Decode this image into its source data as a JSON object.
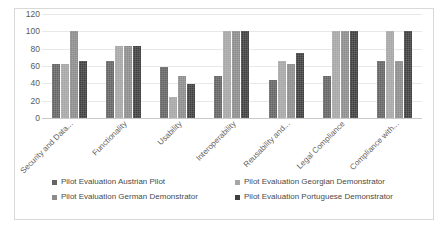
{
  "chart_data": {
    "type": "bar",
    "title": "",
    "xlabel": "",
    "ylabel": "",
    "ylim": [
      0,
      120
    ],
    "yticks": [
      0,
      20,
      40,
      60,
      80,
      100,
      120
    ],
    "grid": true,
    "legend_position": "bottom",
    "categories": [
      "Security and Data...",
      "Functionality",
      "Usability",
      "Interoperability",
      "Reusability and...",
      "Legal Compliance",
      "Compliance with..."
    ],
    "series": [
      {
        "name": "Pilot Evaluation Austrian Pilot",
        "color": "#646464",
        "values": [
          62,
          66,
          59,
          49,
          44,
          49,
          66
        ]
      },
      {
        "name": "Pilot Evaluation Georgian Demonstrator",
        "color": "#a6a6a6",
        "values": [
          62,
          83,
          24,
          100,
          66,
          100,
          100
        ]
      },
      {
        "name": "Pilot Evaluation German Demonstrator",
        "color": "#8c8c8c",
        "values": [
          100,
          83,
          49,
          100,
          62,
          100,
          66
        ]
      },
      {
        "name": "Pilot Evaluation Portuguese Demonstrator",
        "color": "#3f3f3f",
        "values": [
          66,
          83,
          39,
          100,
          75,
          100,
          100
        ]
      }
    ]
  }
}
